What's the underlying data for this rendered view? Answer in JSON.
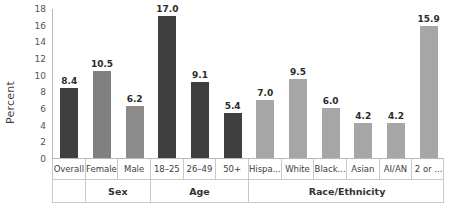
{
  "chart_data": {
    "type": "bar",
    "title": "",
    "subtitle": "",
    "xlabel": "",
    "ylabel": "Percent",
    "ylim": [
      0,
      18
    ],
    "ytick_step": 2,
    "yticks": [
      18,
      16,
      14,
      12,
      10,
      8,
      6,
      4,
      2,
      0
    ],
    "grid": false,
    "legend": "none",
    "categories": [
      "Overall",
      "Female",
      "Male",
      "18–25",
      "26–49",
      "50+",
      "Hispa...",
      "White",
      "Black...",
      "Asian",
      "AI/AN",
      "2 or ..."
    ],
    "values": [
      8.4,
      10.5,
      6.2,
      17.0,
      9.1,
      5.4,
      7.0,
      9.5,
      6.0,
      4.2,
      4.2,
      15.9
    ],
    "value_labels": [
      "8.4",
      "10.5",
      "6.2",
      "17.0",
      "9.1",
      "5.4",
      "7.0",
      "9.5",
      "6.0",
      "4.2",
      "4.2",
      "15.9"
    ],
    "bar_colors": [
      "#3f3f3f",
      "#808080",
      "#8c8c8c",
      "#3f3f3f",
      "#3f3f3f",
      "#3f3f3f",
      "#a6a6a6",
      "#a6a6a6",
      "#a6a6a6",
      "#a6a6a6",
      "#a6a6a6",
      "#a6a6a6"
    ],
    "groups": [
      {
        "label": "",
        "span": 1
      },
      {
        "label": "Sex",
        "span": 2
      },
      {
        "label": "Age",
        "span": 3
      },
      {
        "label": "Race/Ethnicity",
        "span": 6
      }
    ]
  },
  "colors": {
    "dark_bar": "#3f3f3f",
    "mid_bar": "#808080",
    "light_bar": "#a6a6a6",
    "axis": "#b8b8b8",
    "table_border": "#c9c9c9",
    "text": "#3d3d3d",
    "background": "#ffffff"
  }
}
